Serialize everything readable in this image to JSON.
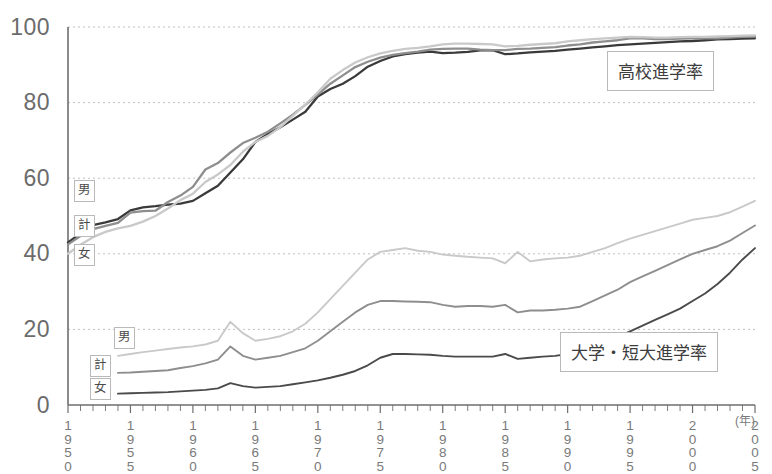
{
  "chart_data": {
    "type": "line",
    "title": "",
    "xlabel": "",
    "ylabel": "",
    "x_unit": "(年)",
    "xlim": [
      1950,
      2005
    ],
    "ylim": [
      0,
      100
    ],
    "yticks": [
      0,
      20,
      40,
      60,
      80,
      100
    ],
    "xticks": [
      1950,
      1955,
      1960,
      1965,
      1970,
      1975,
      1980,
      1985,
      1990,
      1995,
      2000,
      2005
    ],
    "grid": "horizontal-dotted",
    "legend_position": "inline-labels",
    "annotations": [
      {
        "text": "高校進学率",
        "x": 1993,
        "y": 88
      },
      {
        "text": "大学・短大進学率",
        "x": 1988,
        "y": 20
      }
    ],
    "group_labels": [
      {
        "text": "男",
        "group": "high-school",
        "x": 1950,
        "y": 56
      },
      {
        "text": "計",
        "group": "high-school",
        "x": 1950,
        "y": 47
      },
      {
        "text": "女",
        "group": "high-school",
        "x": 1950,
        "y": 40
      },
      {
        "text": "男",
        "group": "university",
        "x": 1953,
        "y": 18
      },
      {
        "text": "計",
        "group": "university",
        "x": 1951,
        "y": 11
      },
      {
        "text": "女",
        "group": "university",
        "x": 1951,
        "y": 5
      }
    ],
    "series": [
      {
        "name": "高校進学率 男",
        "group": "high-school",
        "sex": "男",
        "color": "#3a3a3a",
        "x": [
          1950,
          1951,
          1952,
          1953,
          1954,
          1955,
          1956,
          1957,
          1958,
          1959,
          1960,
          1961,
          1962,
          1963,
          1964,
          1965,
          1966,
          1967,
          1968,
          1969,
          1970,
          1971,
          1972,
          1973,
          1974,
          1975,
          1976,
          1977,
          1978,
          1979,
          1980,
          1981,
          1982,
          1983,
          1984,
          1985,
          1986,
          1987,
          1988,
          1989,
          1990,
          1991,
          1992,
          1993,
          1994,
          1995,
          1996,
          1997,
          1998,
          1999,
          2000,
          2001,
          2002,
          2003,
          2004,
          2005
        ],
        "y": [
          43.0,
          45.4,
          47.6,
          48.3,
          49.2,
          51.5,
          52.3,
          52.6,
          53.0,
          53.3,
          54.0,
          56.0,
          58.0,
          61.5,
          65.0,
          69.6,
          71.7,
          73.5,
          75.5,
          77.6,
          81.6,
          83.6,
          85.0,
          87.0,
          89.5,
          91.0,
          92.2,
          92.8,
          93.2,
          93.5,
          93.1,
          93.2,
          93.4,
          93.8,
          93.9,
          92.8,
          93.0,
          93.3,
          93.5,
          93.7,
          94.0,
          94.3,
          94.6,
          94.9,
          95.2,
          95.4,
          95.6,
          95.8,
          96.0,
          96.2,
          96.3,
          96.5,
          96.7,
          96.8,
          96.9,
          97.0
        ]
      },
      {
        "name": "高校進学率 計",
        "group": "high-school",
        "sex": "計",
        "color": "#8e8e8e",
        "x": [
          1950,
          1951,
          1952,
          1953,
          1954,
          1955,
          1956,
          1957,
          1958,
          1959,
          1960,
          1961,
          1962,
          1963,
          1964,
          1965,
          1966,
          1967,
          1968,
          1969,
          1970,
          1971,
          1972,
          1973,
          1974,
          1975,
          1976,
          1977,
          1978,
          1979,
          1980,
          1981,
          1982,
          1983,
          1984,
          1985,
          1986,
          1987,
          1988,
          1989,
          1990,
          1991,
          1992,
          1993,
          1994,
          1995,
          1996,
          1997,
          1998,
          1999,
          2000,
          2001,
          2002,
          2003,
          2004,
          2005
        ],
        "y": [
          42.5,
          44.7,
          46.5,
          47.4,
          48.2,
          50.9,
          51.3,
          51.4,
          53.7,
          55.4,
          57.7,
          62.3,
          64.0,
          66.8,
          69.3,
          70.7,
          72.3,
          74.5,
          76.8,
          79.4,
          82.1,
          85.0,
          87.2,
          89.4,
          90.8,
          91.9,
          92.6,
          93.1,
          93.5,
          94.0,
          94.2,
          94.3,
          94.3,
          94.0,
          93.9,
          93.9,
          94.2,
          94.3,
          94.5,
          94.7,
          95.1,
          95.4,
          95.9,
          96.2,
          96.5,
          97.0,
          97.0,
          96.8,
          96.8,
          96.9,
          97.0,
          97.0,
          97.0,
          97.2,
          97.4,
          97.6
        ]
      },
      {
        "name": "高校進学率 女",
        "group": "high-school",
        "sex": "女",
        "color": "#c9c9c9",
        "x": [
          1950,
          1951,
          1952,
          1953,
          1954,
          1955,
          1956,
          1957,
          1958,
          1959,
          1960,
          1961,
          1962,
          1963,
          1964,
          1965,
          1966,
          1967,
          1968,
          1969,
          1970,
          1971,
          1972,
          1973,
          1974,
          1975,
          1976,
          1977,
          1978,
          1979,
          1980,
          1981,
          1982,
          1983,
          1984,
          1985,
          1986,
          1987,
          1988,
          1989,
          1990,
          1991,
          1992,
          1993,
          1994,
          1995,
          1996,
          1997,
          1998,
          1999,
          2000,
          2001,
          2002,
          2003,
          2004,
          2005
        ],
        "y": [
          40.0,
          42.4,
          44.4,
          45.8,
          46.7,
          47.4,
          48.5,
          50.0,
          52.0,
          54.2,
          55.9,
          59.0,
          61.0,
          63.5,
          67.0,
          69.6,
          71.2,
          73.5,
          76.5,
          79.5,
          82.7,
          86.3,
          88.6,
          90.6,
          92.0,
          93.0,
          93.7,
          94.2,
          94.5,
          94.9,
          95.4,
          95.6,
          95.6,
          95.5,
          95.4,
          94.9,
          95.0,
          95.3,
          95.5,
          95.7,
          96.2,
          96.5,
          96.8,
          97.0,
          97.2,
          97.4,
          97.3,
          97.2,
          97.2,
          97.3,
          97.4,
          97.4,
          97.5,
          97.6,
          97.7,
          97.8
        ]
      },
      {
        "name": "大学・短大進学率 女",
        "group": "university",
        "sex": "女",
        "color": "#c9c9c9",
        "x": [
          1954,
          1955,
          1956,
          1957,
          1958,
          1959,
          1960,
          1961,
          1962,
          1963,
          1964,
          1965,
          1966,
          1967,
          1968,
          1969,
          1970,
          1971,
          1972,
          1973,
          1974,
          1975,
          1976,
          1977,
          1978,
          1979,
          1980,
          1981,
          1982,
          1983,
          1984,
          1985,
          1986,
          1987,
          1988,
          1989,
          1990,
          1991,
          1992,
          1993,
          1994,
          1995,
          1996,
          1997,
          1998,
          1999,
          2000,
          2001,
          2002,
          2003,
          2004,
          2005
        ],
        "y": [
          13.0,
          13.5,
          14.0,
          14.4,
          14.8,
          15.2,
          15.5,
          16.0,
          17.0,
          22.0,
          19.0,
          17.0,
          17.5,
          18.2,
          19.5,
          21.5,
          24.5,
          28.0,
          31.5,
          35.0,
          38.5,
          40.5,
          41.0,
          41.5,
          40.8,
          40.5,
          39.8,
          39.5,
          39.2,
          39.0,
          38.8,
          37.5,
          40.5,
          38.0,
          38.5,
          38.8,
          39.0,
          39.5,
          40.5,
          41.5,
          42.8,
          44.0,
          45.0,
          46.0,
          47.0,
          48.0,
          49.0,
          49.5,
          50.0,
          51.0,
          52.5,
          54.0
        ]
      },
      {
        "name": "大学・短大進学率 計",
        "group": "university",
        "sex": "計",
        "color": "#8e8e8e",
        "x": [
          1954,
          1955,
          1956,
          1957,
          1958,
          1959,
          1960,
          1961,
          1962,
          1963,
          1964,
          1965,
          1966,
          1967,
          1968,
          1969,
          1970,
          1971,
          1972,
          1973,
          1974,
          1975,
          1976,
          1977,
          1978,
          1979,
          1980,
          1981,
          1982,
          1983,
          1984,
          1985,
          1986,
          1987,
          1988,
          1989,
          1990,
          1991,
          1992,
          1993,
          1994,
          1995,
          1996,
          1997,
          1998,
          1999,
          2000,
          2001,
          2002,
          2003,
          2004,
          2005
        ],
        "y": [
          8.5,
          8.6,
          8.8,
          9.0,
          9.2,
          9.8,
          10.3,
          11.0,
          12.0,
          15.5,
          13.0,
          12.0,
          12.5,
          13.0,
          14.0,
          15.0,
          17.0,
          19.5,
          22.0,
          24.5,
          26.5,
          27.5,
          27.5,
          27.4,
          27.3,
          27.2,
          26.5,
          26.0,
          26.2,
          26.2,
          26.0,
          26.5,
          24.5,
          25.0,
          25.0,
          25.2,
          25.5,
          26.0,
          27.5,
          29.0,
          30.5,
          32.5,
          34.0,
          35.5,
          37.0,
          38.5,
          40.0,
          41.0,
          42.0,
          43.5,
          45.5,
          47.5
        ]
      },
      {
        "name": "大学・短大進学率 男",
        "group": "university",
        "sex": "男",
        "color": "#4a4a4a",
        "x": [
          1954,
          1955,
          1956,
          1957,
          1958,
          1959,
          1960,
          1961,
          1962,
          1963,
          1964,
          1965,
          1966,
          1967,
          1968,
          1969,
          1970,
          1971,
          1972,
          1973,
          1974,
          1975,
          1976,
          1977,
          1978,
          1979,
          1980,
          1981,
          1982,
          1983,
          1984,
          1985,
          1986,
          1987,
          1988,
          1989,
          1990,
          1991,
          1992,
          1993,
          1994,
          1995,
          1996,
          1997,
          1998,
          1999,
          2000,
          2001,
          2002,
          2003,
          2004,
          2005
        ],
        "y": [
          3.0,
          3.1,
          3.2,
          3.3,
          3.4,
          3.6,
          3.8,
          4.0,
          4.4,
          5.8,
          5.0,
          4.6,
          4.8,
          5.0,
          5.5,
          6.0,
          6.5,
          7.2,
          8.0,
          9.0,
          10.5,
          12.5,
          13.5,
          13.5,
          13.4,
          13.3,
          13.0,
          12.8,
          12.8,
          12.8,
          12.8,
          13.5,
          12.2,
          12.5,
          12.8,
          13.0,
          13.5,
          14.5,
          15.5,
          16.5,
          18.0,
          19.5,
          21.0,
          22.5,
          24.0,
          25.5,
          27.5,
          29.5,
          32.0,
          35.0,
          38.5,
          41.5
        ]
      }
    ]
  },
  "axis": {
    "y_tick_labels": [
      "0",
      "20",
      "40",
      "60",
      "80",
      "100"
    ],
    "x_tick_labels": [
      "1950",
      "1955",
      "1960",
      "1965",
      "1970",
      "1975",
      "1980",
      "1985",
      "1990",
      "1995",
      "2000",
      "2005"
    ],
    "x_unit_label": "(年)"
  },
  "labels": {
    "hs_male": "男",
    "hs_total": "計",
    "hs_female": "女",
    "uni_male": "男",
    "uni_total": "計",
    "uni_female": "女",
    "anno_high_school": "高校進学率",
    "anno_university": "大学・短大進学率"
  },
  "colors": {
    "dark": "#3a3a3a",
    "medium": "#8e8e8e",
    "light": "#c9c9c9",
    "grid": "#c0c0c0",
    "axis": "#6e6e6e",
    "text": "#6b6b6b"
  }
}
